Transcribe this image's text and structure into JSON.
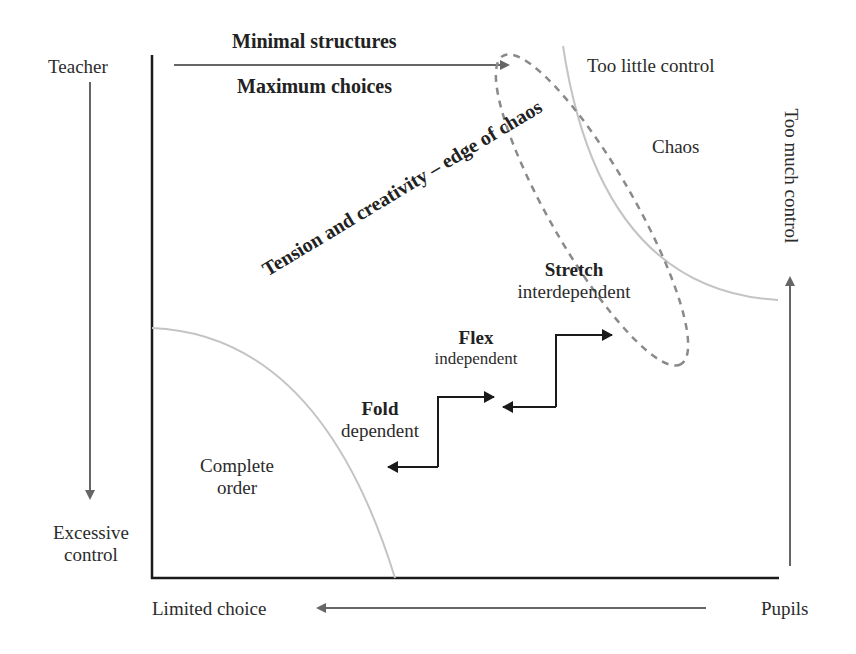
{
  "diagram": {
    "top_arrow": {
      "label_top": "Minimal structures",
      "label_bottom": "Maximum choices"
    },
    "left_axis": {
      "top_label": "Teacher",
      "bottom_label_line1": "Excessive",
      "bottom_label_line2": "control"
    },
    "right_axis": {
      "vertical_label": "Too much control"
    },
    "bottom_axis": {
      "left_label": "Limited choice",
      "right_label": "Pupils"
    },
    "regions": {
      "top_right": "Too little control",
      "chaos": "Chaos",
      "order_line1": "Complete",
      "order_line2": "order"
    },
    "diagonal_label": "Tension and creativity – edge of chaos",
    "stages": [
      {
        "title": "Fold",
        "subtitle": "dependent"
      },
      {
        "title": "Flex",
        "subtitle": "independent"
      },
      {
        "title": "Stretch",
        "subtitle": "interdependent"
      }
    ],
    "colors": {
      "axis": "#1a1a1a",
      "arrow": "#666666",
      "arc": "#c4c4c4",
      "dashed_ellipse": "#8a8a8a",
      "step_arrow": "#1a1a1a"
    }
  }
}
